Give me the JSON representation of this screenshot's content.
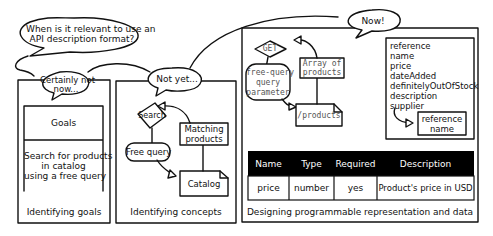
{
  "bubbles": {
    "question": "When is it relevant to use an API description format?",
    "question_line1": "When is it relevant to use an",
    "question_line2": "API description format?",
    "certainly_not_line1": "Certainly not",
    "certainly_not_line2": "now...",
    "not_yet": "Not yet...",
    "now": "Now!"
  },
  "panel_goals": {
    "box_title": "Goals",
    "goal_line1": "Search for products",
    "goal_line2": "in catalog",
    "goal_line3": "using a free query",
    "caption": "Identifying goals"
  },
  "panel_concepts": {
    "search": "Search",
    "free_query": "Free query",
    "matching_line1": "Matching",
    "matching_line2": "products",
    "catalog": "Catalog",
    "caption": "Identifying concepts"
  },
  "panel_design": {
    "get": "GET",
    "param_line1": "free-query",
    "param_line2": "query",
    "param_line3": "parameter",
    "array_line1": "Array of",
    "array_line2": "products",
    "path": "/products",
    "properties": [
      "reference",
      "name",
      "price",
      "dateAdded",
      "definitelyOutOfStock",
      "description",
      "supplier"
    ],
    "supplier_line1": "reference",
    "supplier_line2": "name",
    "table": {
      "headers": [
        "Name",
        "Type",
        "Required",
        "Description"
      ],
      "rows": [
        [
          "price",
          "number",
          "yes",
          "Product's price in USD"
        ]
      ]
    },
    "caption": "Designing programmable representation and data"
  }
}
